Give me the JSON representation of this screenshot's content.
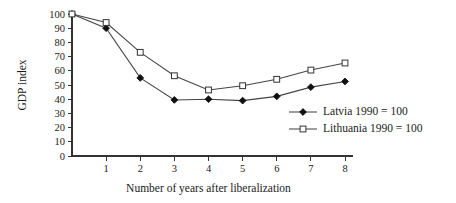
{
  "chart_data": {
    "type": "line",
    "title": "",
    "xlabel": "Number of years after liberalization",
    "ylabel": "GDP index",
    "x": [
      0,
      1,
      2,
      3,
      4,
      5,
      6,
      7,
      8
    ],
    "xlim": [
      0,
      8
    ],
    "ylim": [
      0,
      100
    ],
    "xticks": [
      "1",
      "2",
      "3",
      "4",
      "5",
      "6",
      "7",
      "8"
    ],
    "xtick_values": [
      1,
      2,
      3,
      4,
      5,
      6,
      7,
      8
    ],
    "yticks": [
      "0",
      "10",
      "20",
      "30",
      "40",
      "50",
      "60",
      "70",
      "80",
      "90",
      "100"
    ],
    "ytick_values": [
      0,
      10,
      20,
      30,
      40,
      50,
      60,
      70,
      80,
      90,
      100
    ],
    "grid": false,
    "legend_position": "center-right",
    "series": [
      {
        "name": "Latvia 1990 = 100",
        "marker": "filled-diamond",
        "color": "#111111",
        "values": [
          100,
          90,
          55,
          39.5,
          40,
          39,
          42,
          48.5,
          52.5
        ]
      },
      {
        "name": "Lithuania 1990 = 100",
        "marker": "open-square",
        "color": "#333333",
        "values": [
          100,
          94,
          73,
          56.5,
          46.5,
          49.5,
          54,
          60.5,
          65.5
        ]
      }
    ]
  },
  "legend": {
    "items": [
      {
        "label": "Latvia 1990 = 100",
        "marker": "filled-diamond"
      },
      {
        "label": "Lithuania 1990 = 100",
        "marker": "open-square"
      }
    ]
  }
}
